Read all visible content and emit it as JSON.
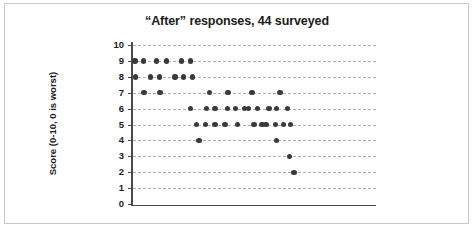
{
  "figure": {
    "title": "“After” responses, 44 surveyed",
    "background_color": "#ffffff",
    "frame_color": "#c9c9c9"
  },
  "axis": {
    "y_title": "Score (0-10, 0 is worst)",
    "y_ticks": [
      "10",
      "9",
      "8",
      "7",
      "6",
      "5",
      "4",
      "3",
      "2",
      "1",
      "0"
    ],
    "axis_color": "#4a4a4a",
    "gridline_color": "#b0b0b0",
    "point_color": "#3a3a3a"
  },
  "chart_data": {
    "type": "scatter",
    "title": "“After” responses, 44 surveyed",
    "xlabel": "",
    "ylabel": "Score (0-10, 0 is worst)",
    "ylim": [
      0,
      10
    ],
    "xlim": [
      0,
      45
    ],
    "grid": true,
    "legend": "none",
    "y_ticks": [
      0,
      1,
      2,
      3,
      4,
      5,
      6,
      7,
      8,
      9,
      10
    ],
    "x_axis_visible": true,
    "x_tick_labels": [],
    "n_points": 44,
    "annotations": [],
    "series": [
      {
        "name": "After responses",
        "color": "#3a3a3a",
        "marker": "circle",
        "points": [
          {
            "x": 0.4,
            "y": 9
          },
          {
            "x": 1.9,
            "y": 9
          },
          {
            "x": 4.4,
            "y": 9
          },
          {
            "x": 6.2,
            "y": 9
          },
          {
            "x": 9.0,
            "y": 9
          },
          {
            "x": 10.6,
            "y": 9
          },
          {
            "x": 0.5,
            "y": 8
          },
          {
            "x": 3.2,
            "y": 8
          },
          {
            "x": 4.9,
            "y": 8
          },
          {
            "x": 7.8,
            "y": 8
          },
          {
            "x": 9.4,
            "y": 8
          },
          {
            "x": 11.0,
            "y": 8
          },
          {
            "x": 2.0,
            "y": 7
          },
          {
            "x": 5.0,
            "y": 7
          },
          {
            "x": 14.2,
            "y": 7
          },
          {
            "x": 17.6,
            "y": 7
          },
          {
            "x": 22.0,
            "y": 7
          },
          {
            "x": 27.2,
            "y": 7
          },
          {
            "x": 10.6,
            "y": 6
          },
          {
            "x": 13.6,
            "y": 6
          },
          {
            "x": 15.2,
            "y": 6
          },
          {
            "x": 17.5,
            "y": 6
          },
          {
            "x": 19.0,
            "y": 6
          },
          {
            "x": 20.6,
            "y": 6
          },
          {
            "x": 21.4,
            "y": 6
          },
          {
            "x": 23.0,
            "y": 6
          },
          {
            "x": 25.2,
            "y": 6
          },
          {
            "x": 26.6,
            "y": 6
          },
          {
            "x": 28.6,
            "y": 6
          },
          {
            "x": 11.8,
            "y": 5
          },
          {
            "x": 13.4,
            "y": 5
          },
          {
            "x": 15.2,
            "y": 5
          },
          {
            "x": 17.0,
            "y": 5
          },
          {
            "x": 19.3,
            "y": 5
          },
          {
            "x": 22.4,
            "y": 5
          },
          {
            "x": 23.9,
            "y": 5
          },
          {
            "x": 24.6,
            "y": 5
          },
          {
            "x": 26.4,
            "y": 5
          },
          {
            "x": 27.9,
            "y": 5
          },
          {
            "x": 29.2,
            "y": 5
          },
          {
            "x": 12.2,
            "y": 4
          },
          {
            "x": 26.6,
            "y": 4
          },
          {
            "x": 29.0,
            "y": 3
          },
          {
            "x": 29.8,
            "y": 2
          }
        ]
      }
    ]
  }
}
